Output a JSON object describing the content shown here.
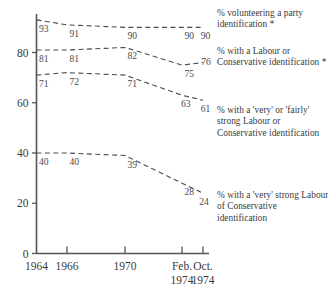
{
  "chart_data": {
    "type": "line",
    "title": "",
    "xlabel": "",
    "ylabel": "",
    "ylim": [
      0,
      100
    ],
    "yticks": [
      0,
      20,
      40,
      60,
      80
    ],
    "ytick_labels": [
      "0",
      "20",
      "40",
      "60",
      "80"
    ],
    "grid": false,
    "legend_position": "right",
    "categories": [
      "1964",
      "1966",
      "1970",
      "Feb. 1974",
      "Oct. 1974"
    ],
    "xtick_labels": [
      {
        "line1": "1964",
        "line2": ""
      },
      {
        "line1": "1966",
        "line2": ""
      },
      {
        "line1": "1970",
        "line2": ""
      },
      {
        "line1": "Feb.",
        "line2": "1974"
      },
      {
        "line1": "Oct.",
        "line2": "1974"
      }
    ],
    "series": [
      {
        "name": "% volunteering a party identification *",
        "values": [
          93,
          91,
          90,
          90,
          90
        ],
        "label_text": [
          "93",
          "91",
          "90",
          "90",
          "90"
        ],
        "style": "dashed"
      },
      {
        "name": "% with a Labour or Conservative identification *",
        "values": [
          81,
          81,
          82,
          75,
          76
        ],
        "label_text": [
          "81",
          "81",
          "82",
          "75",
          "76"
        ],
        "style": "dashed"
      },
      {
        "name": "% with a 'very' or 'fairly' strong Labour or Conservative identification",
        "values": [
          71,
          72,
          71,
          63,
          61
        ],
        "label_text": [
          "71",
          "72",
          "71",
          "63",
          "61"
        ],
        "style": "dashed"
      },
      {
        "name": "% with a 'very' strong Labour of Conservative identification",
        "values": [
          40,
          40,
          39,
          28,
          24
        ],
        "label_text": [
          "40",
          "40",
          "39",
          "28",
          "24"
        ],
        "style": "dashed"
      }
    ]
  },
  "legend": {
    "entries": [
      {
        "text": "% volunteering a party identification *"
      },
      {
        "text": "% with a Labour or Conservative identification *"
      },
      {
        "text": "% with a 'very' or 'fairly' strong Labour or Conservative identification"
      },
      {
        "text": "% with a 'very' strong Labour of Conservative identification"
      }
    ]
  }
}
